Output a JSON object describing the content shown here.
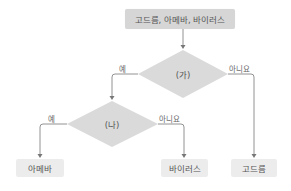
{
  "colors": {
    "start_box": "#d6d6d6",
    "diamond": "#dadada",
    "leaf_box": "#ececec",
    "line": "#777777",
    "text": "#555555"
  },
  "nodes": {
    "start": {
      "label": "고드름, 아메바, 바이러스"
    },
    "decision_a": {
      "label": "(가)"
    },
    "decision_b": {
      "label": "(나)"
    },
    "leaf_amoeba": {
      "label": "아메바"
    },
    "leaf_virus": {
      "label": "바이러스"
    },
    "leaf_icicle": {
      "label": "고드름"
    }
  },
  "edges": {
    "a_yes": {
      "label": "예"
    },
    "a_no": {
      "label": "아니요"
    },
    "b_yes": {
      "label": "예"
    },
    "b_no": {
      "label": "아니요"
    }
  }
}
